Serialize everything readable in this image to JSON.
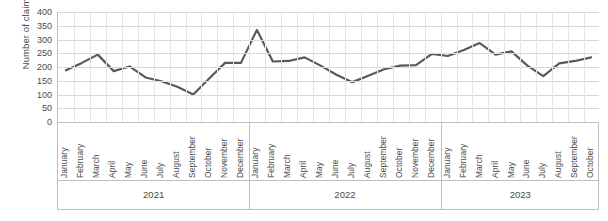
{
  "chart_data": {
    "type": "line",
    "title": "",
    "subtitle": "",
    "xlabel": "",
    "ylabel": "Number of claims",
    "ylim": [
      0,
      400
    ],
    "ytick_step": 50,
    "yticks": [
      "400",
      "350",
      "300",
      "250",
      "200",
      "150",
      "100",
      "50",
      "0"
    ],
    "grid": true,
    "legend": "none",
    "line_color": "#595959",
    "categories": [
      "January",
      "February",
      "March",
      "April",
      "May",
      "June",
      "July",
      "August",
      "September",
      "October",
      "November",
      "December",
      "January",
      "February",
      "March",
      "April",
      "May",
      "June",
      "July",
      "August",
      "September",
      "October",
      "November",
      "December",
      "January",
      "February",
      "March",
      "April",
      "May",
      "June",
      "July",
      "August",
      "September",
      "October"
    ],
    "values": [
      188,
      215,
      245,
      185,
      202,
      162,
      148,
      128,
      100,
      158,
      215,
      215,
      335,
      220,
      222,
      235,
      205,
      172,
      145,
      168,
      192,
      205,
      207,
      248,
      240,
      262,
      287,
      245,
      257,
      205,
      167,
      213,
      222,
      235
    ],
    "year_groups": [
      {
        "label": "2021",
        "count": 12
      },
      {
        "label": "2022",
        "count": 12
      },
      {
        "label": "2023",
        "count": 10
      }
    ]
  }
}
